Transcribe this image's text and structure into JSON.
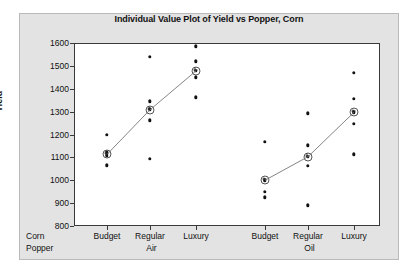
{
  "chart_data": {
    "type": "scatter",
    "title": "Individual Value Plot of Yield vs Popper, Corn",
    "xlabel": "",
    "ylabel": "Yield",
    "ylim": [
      800,
      1600
    ],
    "yticks": [
      1600,
      1500,
      1400,
      1300,
      1200,
      1100,
      1000,
      900,
      800
    ],
    "grid": false,
    "legend": "none",
    "axis_row_labels": [
      "Popper",
      "Corn"
    ],
    "group_labels": [
      "Air",
      "Oil"
    ],
    "categories": [
      "Budget",
      "Regular",
      "Luxury",
      "Budget",
      "Regular",
      "Luxury"
    ],
    "groups": [
      {
        "corn": "Air",
        "popper": "Budget",
        "values": [
          1200,
          1125,
          1115,
          1108,
          1065
        ],
        "mean": 1113
      },
      {
        "corn": "Air",
        "popper": "Regular",
        "values": [
          1540,
          1345,
          1310,
          1262,
          1093
        ],
        "mean": 1308
      },
      {
        "corn": "Air",
        "popper": "Luxury",
        "values": [
          1585,
          1520,
          1478,
          1450,
          1362
        ],
        "mean": 1478
      },
      {
        "corn": "Oil",
        "popper": "Budget",
        "values": [
          1167,
          1000,
          950,
          925
        ],
        "mean": 1000
      },
      {
        "corn": "Oil",
        "popper": "Regular",
        "values": [
          1293,
          1152,
          1103,
          1062,
          890
        ],
        "mean": 1103
      },
      {
        "corn": "Oil",
        "popper": "Luxury",
        "values": [
          1470,
          1355,
          1297,
          1247,
          1113
        ],
        "mean": 1297
      }
    ],
    "mean_connect_lines": [
      [
        1113,
        1308,
        1478
      ],
      [
        1000,
        1103,
        1297
      ]
    ],
    "colors": {
      "point": "#111111",
      "mean_marker": "#333333",
      "connector": "#777777",
      "panel_background": "#e3e3e3",
      "plot_background": "#ffffff",
      "axis": "#3a3a3a"
    }
  }
}
